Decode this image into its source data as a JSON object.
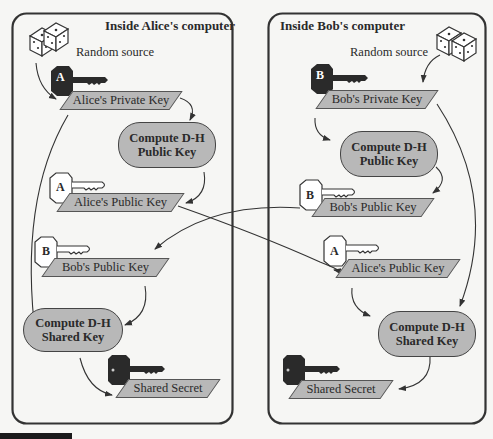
{
  "alice": {
    "title": "Inside Alice's computer",
    "random_source": "Random source",
    "private_key": "Alice's Private Key",
    "private_key_badge": "A",
    "compute_public": {
      "line1": "Compute D-H",
      "line2": "Public Key"
    },
    "own_public_key": "Alice's Public Key",
    "own_public_badge": "A",
    "received_public_key": "Bob's Public Key",
    "received_public_badge": "B",
    "compute_shared": {
      "line1": "Compute D-H",
      "line2": "Shared Key"
    },
    "shared_secret": "Shared Secret"
  },
  "bob": {
    "title": "Inside Bob's computer",
    "random_source": "Random source",
    "private_key": "Bob's Private Key",
    "private_key_badge": "B",
    "compute_public": {
      "line1": "Compute D-H",
      "line2": "Public Key"
    },
    "own_public_key": "Bob's Public Key",
    "own_public_badge": "B",
    "received_public_key": "Alice's Public Key",
    "received_public_badge": "A",
    "compute_shared": {
      "line1": "Compute D-H",
      "line2": "Shared Key"
    },
    "shared_secret": "Shared Secret"
  },
  "colors": {
    "shape_fill": "#b8b8b8",
    "border": "#333333",
    "key_dark": "#2a2a2a"
  }
}
